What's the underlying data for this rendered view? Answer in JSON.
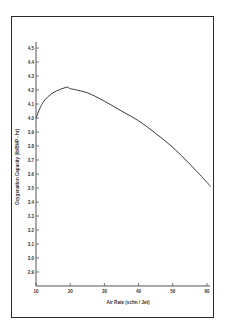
{
  "chart_data": {
    "type": "line",
    "title": "",
    "xlabel": "Air Rate (scfm / Jet)",
    "ylabel": "Oxygenation Capacity (lb/BHP - hr)",
    "xlim": [
      10,
      61
    ],
    "ylim": [
      2.8,
      4.6
    ],
    "x_ticks": [
      10,
      20,
      30,
      40,
      50,
      60
    ],
    "y_ticks": [
      2.9,
      3.0,
      3.1,
      3.2,
      3.3,
      3.4,
      3.5,
      3.6,
      3.7,
      3.8,
      3.9,
      4.0,
      4.1,
      4.2,
      4.3,
      4.4,
      4.5
    ],
    "x_tick_labels": [
      "10",
      "20",
      "30",
      "40",
      "50",
      "60"
    ],
    "y_tick_labels": [
      "2.9",
      "3.0",
      "3.1",
      "3.2",
      "3.3",
      "3.4",
      "3.5",
      "3.6",
      "3.7",
      "3.8",
      "3.9",
      "4.0",
      "4.1",
      "4.2",
      "4.3",
      "4.4",
      "4.5"
    ],
    "grid": false,
    "legend": null,
    "series": [
      {
        "name": "Oxygenation Capacity",
        "x": [
          10,
          12,
          15,
          19,
          20,
          25,
          30,
          35,
          40,
          45,
          50,
          55,
          60,
          61
        ],
        "y": [
          4.0,
          4.11,
          4.18,
          4.22,
          4.21,
          4.18,
          4.12,
          4.05,
          3.98,
          3.89,
          3.79,
          3.67,
          3.54,
          3.51
        ]
      }
    ]
  }
}
